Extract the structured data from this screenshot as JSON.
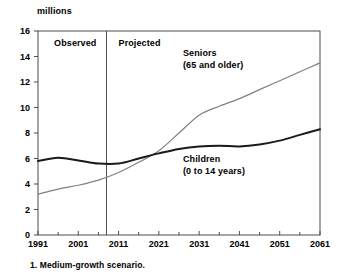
{
  "chart_data": {
    "type": "line",
    "title": "",
    "subtitle": "",
    "ylabel": "millions",
    "xlabel": "",
    "ylim": [
      0,
      16
    ],
    "xlim": [
      1991,
      2061
    ],
    "yticks": [
      "0",
      "2",
      "4",
      "6",
      "8",
      "10",
      "12",
      "14",
      "16"
    ],
    "ytick_values": [
      0,
      2,
      4,
      6,
      8,
      10,
      12,
      14,
      16
    ],
    "xticks": [
      "1991",
      "2001",
      "2011",
      "2021",
      "2031",
      "2041",
      "2051",
      "2061"
    ],
    "xtick_values": [
      1991,
      2001,
      2011,
      2021,
      2031,
      2041,
      2051,
      2061
    ],
    "minor_xtick_values": [
      1996,
      2006,
      2016,
      2026,
      2036,
      2046,
      2056
    ],
    "grid": false,
    "legend_position": "inline-annotations",
    "footnote": "1. Medium-growth scenario.",
    "region_divider_year": 2008,
    "regions": [
      {
        "label": "Observed",
        "x": 1995,
        "y": 15.0
      },
      {
        "label": "Projected",
        "x": 2011,
        "y": 15.0
      }
    ],
    "annotations": [
      {
        "name": "seniors",
        "line1": "Seniors",
        "line2": "(65 and older)",
        "x": 2027,
        "y": 14.2
      },
      {
        "name": "children",
        "line1": "Children",
        "line2": "(0 to 14 years)",
        "x": 2027,
        "y": 5.9
      }
    ],
    "series": [
      {
        "name": "Seniors (65 and older)",
        "color": "#808080",
        "width": 1.2,
        "x": [
          1991,
          1996,
          2001,
          2006,
          2011,
          2016,
          2021,
          2026,
          2031,
          2036,
          2041,
          2046,
          2051,
          2056,
          2061
        ],
        "values": [
          3.2,
          3.6,
          3.9,
          4.3,
          4.9,
          5.7,
          6.6,
          8.0,
          9.4,
          10.1,
          10.7,
          11.4,
          12.1,
          12.8,
          13.5
        ]
      },
      {
        "name": "Children (0 to 14 years)",
        "color": "#1a1a1a",
        "width": 2.0,
        "x": [
          1991,
          1996,
          2001,
          2006,
          2011,
          2016,
          2021,
          2026,
          2031,
          2036,
          2041,
          2046,
          2051,
          2056,
          2061
        ],
        "values": [
          5.8,
          6.05,
          5.85,
          5.6,
          5.6,
          6.0,
          6.4,
          6.75,
          6.95,
          7.0,
          6.95,
          7.1,
          7.4,
          7.85,
          8.3
        ]
      }
    ]
  }
}
